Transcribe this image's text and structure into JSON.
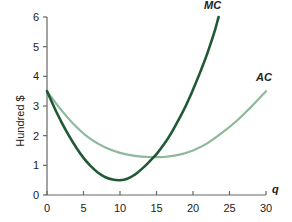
{
  "chart_data": {
    "type": "line",
    "title": "",
    "xlabel": "q",
    "ylabel": "Hundred $",
    "xlim": [
      0,
      30
    ],
    "ylim": [
      0,
      6
    ],
    "xticks": [
      0,
      5,
      10,
      15,
      20,
      25,
      30
    ],
    "yticks": [
      0,
      1,
      2,
      3,
      4,
      5,
      6
    ],
    "grid": false,
    "legend": "inline-labels",
    "series": [
      {
        "name": "MC",
        "color": "#1f5a34",
        "points": [
          [
            0,
            3.5
          ],
          [
            1,
            2.95
          ],
          [
            2,
            2.45
          ],
          [
            3,
            2.0
          ],
          [
            4,
            1.6
          ],
          [
            5,
            1.25
          ],
          [
            6,
            0.97
          ],
          [
            7,
            0.75
          ],
          [
            8,
            0.6
          ],
          [
            9,
            0.52
          ],
          [
            10,
            0.5
          ],
          [
            11,
            0.55
          ],
          [
            12,
            0.68
          ],
          [
            13,
            0.88
          ],
          [
            14,
            1.12
          ],
          [
            15,
            1.38
          ],
          [
            16,
            1.7
          ],
          [
            17,
            2.08
          ],
          [
            18,
            2.52
          ],
          [
            19,
            3.0
          ],
          [
            20,
            3.55
          ],
          [
            21,
            4.15
          ],
          [
            22,
            4.8
          ],
          [
            23,
            5.55
          ],
          [
            23.5,
            6.0
          ]
        ]
      },
      {
        "name": "AC",
        "color": "#8db89a",
        "points": [
          [
            0,
            3.5
          ],
          [
            2,
            2.85
          ],
          [
            4,
            2.3
          ],
          [
            6,
            1.88
          ],
          [
            8,
            1.6
          ],
          [
            10,
            1.42
          ],
          [
            12,
            1.32
          ],
          [
            14,
            1.28
          ],
          [
            16,
            1.28
          ],
          [
            18,
            1.35
          ],
          [
            20,
            1.5
          ],
          [
            22,
            1.75
          ],
          [
            24,
            2.1
          ],
          [
            26,
            2.5
          ],
          [
            28,
            2.98
          ],
          [
            30,
            3.5
          ]
        ]
      }
    ]
  }
}
